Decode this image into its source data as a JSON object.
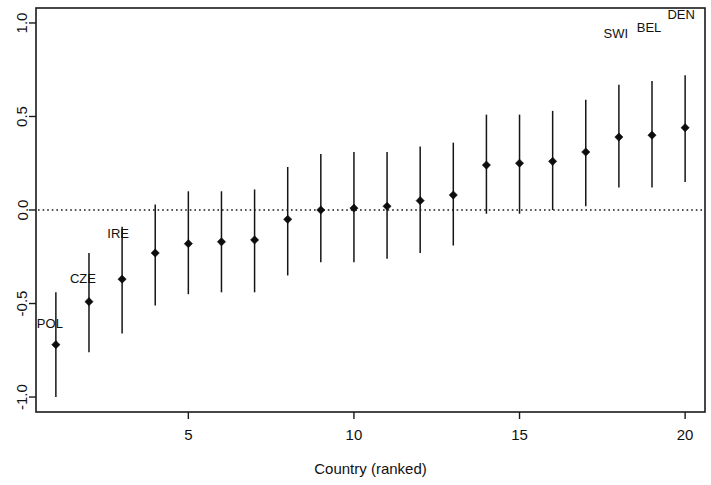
{
  "chart_data": {
    "type": "scatter",
    "title": "",
    "subtitle": "",
    "xlabel": "Country (ranked)",
    "ylabel": "",
    "xlim": [
      0.4,
      20.6
    ],
    "ylim": [
      -1.08,
      1.08
    ],
    "xticks": [
      5,
      10,
      15,
      20
    ],
    "xtick_labels": [
      "5",
      "10",
      "15",
      "20"
    ],
    "yticks": [
      1.0,
      0.5,
      0.0,
      -0.5,
      -1.0
    ],
    "ytick_labels": [
      "1.0",
      "0.5",
      "0.0",
      "-0.5",
      "-1.0"
    ],
    "grid": false,
    "legend": null,
    "reference_line": {
      "y": 0.0,
      "style": "dotted"
    },
    "x": [
      1,
      2,
      3,
      4,
      5,
      6,
      7,
      8,
      9,
      10,
      11,
      12,
      13,
      14,
      15,
      16,
      17,
      18,
      19,
      20
    ],
    "values": [
      -0.72,
      -0.49,
      -0.37,
      -0.23,
      -0.18,
      -0.17,
      -0.16,
      -0.05,
      0.0,
      0.01,
      0.02,
      0.05,
      0.08,
      0.24,
      0.25,
      0.26,
      0.31,
      0.39,
      0.4,
      0.44
    ],
    "ci_low": [
      -1.0,
      -0.76,
      -0.66,
      -0.51,
      -0.45,
      -0.44,
      -0.44,
      -0.35,
      -0.28,
      -0.28,
      -0.26,
      -0.23,
      -0.19,
      -0.02,
      -0.02,
      0.0,
      0.02,
      0.12,
      0.12,
      0.15
    ],
    "ci_high": [
      -0.44,
      -0.23,
      -0.09,
      0.03,
      0.1,
      0.1,
      0.11,
      0.23,
      0.3,
      0.31,
      0.31,
      0.34,
      0.36,
      0.51,
      0.51,
      0.53,
      0.59,
      0.67,
      0.69,
      0.72
    ],
    "point_labels": [
      {
        "x": 1,
        "text": "POL",
        "dx": -6,
        "dy": -0.19
      },
      {
        "x": 2,
        "text": "CZE",
        "dx": -6,
        "dy": -0.16
      },
      {
        "x": 3,
        "text": "IRE",
        "dx": -4,
        "dy": -0.06
      },
      {
        "x": 18,
        "text": "SWI",
        "dx": -3,
        "dy": 0.25
      },
      {
        "x": 19,
        "text": "BEL",
        "dx": -3,
        "dy": 0.26
      },
      {
        "x": 20,
        "text": "DEN",
        "dx": -4,
        "dy": 0.3
      }
    ],
    "colors": {
      "point": "#0d0d0d",
      "error_bar": "#151515",
      "axis": "#1a1a1a",
      "reference_line": "#1a1a1a",
      "background": "#ffffff"
    }
  }
}
